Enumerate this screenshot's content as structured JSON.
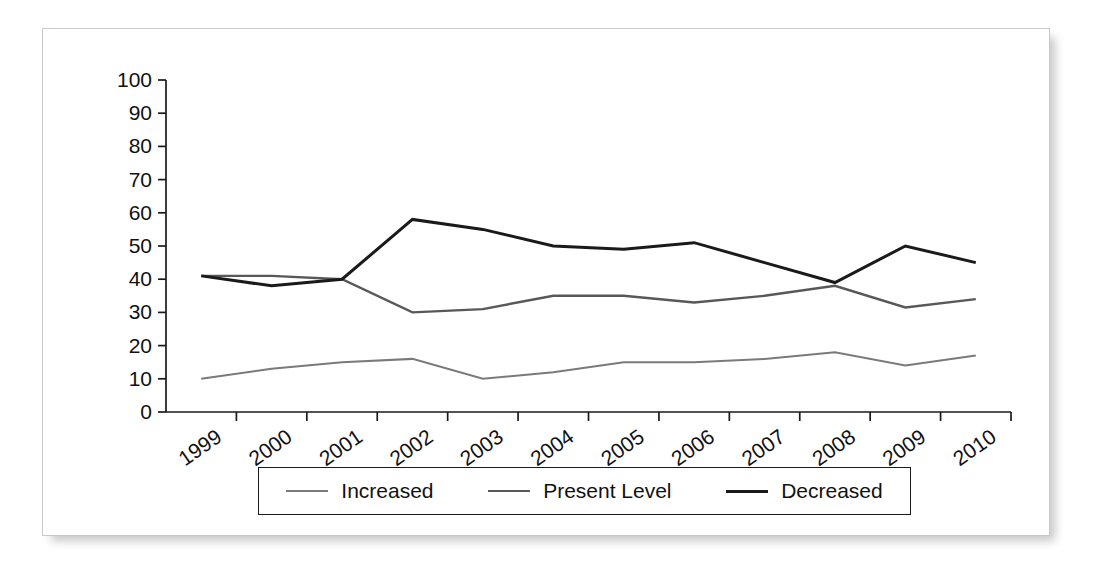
{
  "chart_data": {
    "type": "line",
    "title": "",
    "xlabel": "",
    "ylabel": "",
    "categories": [
      "1999",
      "2000",
      "2001",
      "2002",
      "2003",
      "2004",
      "2005",
      "2006",
      "2007",
      "2008",
      "2009",
      "2010"
    ],
    "ylim": [
      0,
      100
    ],
    "y_ticks": [
      0,
      10,
      20,
      30,
      40,
      50,
      60,
      70,
      80,
      90,
      100
    ],
    "grid": false,
    "legend_position": "bottom",
    "x_tick_rotation": -35,
    "series": [
      {
        "name": "Increased",
        "color": "#7a7a7a",
        "stroke_width": 2.0,
        "values": [
          10,
          13,
          15,
          16,
          10,
          12,
          15,
          15,
          16,
          18,
          14,
          17
        ]
      },
      {
        "name": "Present Level",
        "color": "#585858",
        "stroke_width": 2.4,
        "values": [
          41,
          41,
          40,
          30,
          31,
          35,
          35,
          33,
          35,
          38,
          31.5,
          34
        ]
      },
      {
        "name": "Decreased",
        "color": "#1a1a1a",
        "stroke_width": 3.0,
        "values": [
          41,
          38,
          40,
          58,
          55,
          50,
          49,
          51,
          45,
          39,
          50,
          45
        ]
      }
    ]
  },
  "legend": {
    "entries": [
      {
        "label": "Increased"
      },
      {
        "label": "Present Level"
      },
      {
        "label": "Decreased"
      }
    ]
  },
  "frame": {
    "border_color": "#c9c9c9",
    "background": "#ffffff"
  }
}
